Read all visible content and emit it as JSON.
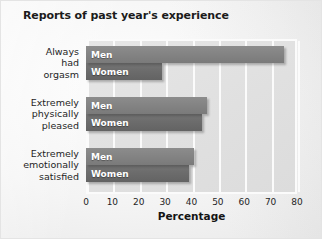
{
  "chart_data": {
    "type": "bar",
    "orientation": "horizontal",
    "title": "Reports of past year's experience",
    "xlabel": "Percentage",
    "ylabel": "",
    "xlim": [
      0,
      80
    ],
    "xticks": [
      0,
      10,
      20,
      30,
      40,
      50,
      60,
      70,
      80
    ],
    "grid": true,
    "legend_position": "inside-bars",
    "categories": [
      "Always\nhad\norgasm",
      "Extremely\nphysically\npleased",
      "Extremely\nemotionally\nsatisfied"
    ],
    "categories_flat": [
      "Always had orgasm",
      "Extremely physically pleased",
      "Extremely emotionally satisfied"
    ],
    "series": [
      {
        "name": "Men",
        "color": "#848484",
        "values": [
          75,
          46,
          41
        ]
      },
      {
        "name": "Women",
        "color": "#6c6c6c",
        "values": [
          29,
          44,
          39
        ]
      }
    ]
  },
  "figure": {
    "background_color": "#ededed",
    "plot_background_color": "#e1e1e1",
    "gridline_color": "#fbfbfb",
    "axis_frame_color": "#fbfbfb",
    "text_color": "#1f1f1f"
  },
  "category_labels": [
    {
      "lines": [
        "Always",
        "had",
        "orgasm"
      ]
    },
    {
      "lines": [
        "Extremely",
        "physically",
        "pleased"
      ]
    },
    {
      "lines": [
        "Extremely",
        "emotionally",
        "satisfied"
      ]
    }
  ],
  "bar_labels": [
    {
      "men": "Men",
      "women": "Women"
    },
    {
      "men": "Men",
      "women": "Women"
    },
    {
      "men": "Men",
      "women": "Women"
    }
  ]
}
